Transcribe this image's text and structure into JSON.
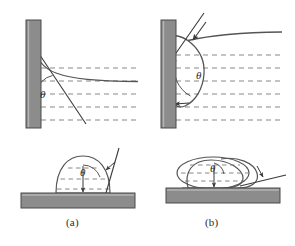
{
  "figure": {
    "type": "scientific-diagram",
    "panels": [
      {
        "id": "a",
        "caption": "(a)",
        "regime": "hydrophilic",
        "angle_symbol": "θ",
        "description": "Acute contact angle: liquid climbs the wall; droplet is a low spherical cap.",
        "top_view": {
          "kind": "vertical-wall-meniscus",
          "angle_label": "θ",
          "angle_value_deg": 40,
          "wall_side": "left",
          "meniscus": "rises-along-wall"
        },
        "bottom_view": {
          "kind": "sessile-droplet-on-substrate",
          "angle_label": "θ",
          "angle_value_deg": 75,
          "droplet_shape": "spherical-cap-tall"
        }
      },
      {
        "id": "b",
        "caption": "(b)",
        "regime": "hydrophobic",
        "angle_symbol": "θ",
        "description": "Obtuse contact angle: liquid is depressed at the wall; droplet is a flattened bead.",
        "top_view": {
          "kind": "vertical-wall-meniscus",
          "angle_label": "θ",
          "angle_value_deg": 135,
          "wall_side": "left",
          "meniscus": "bulges-away-from-wall"
        },
        "bottom_view": {
          "kind": "sessile-droplet-on-substrate",
          "angle_label": "θ",
          "angle_value_deg": 150,
          "droplet_shape": "flattened-bead"
        }
      }
    ],
    "colors": {
      "solid_fill": "#8c8c8c",
      "solid_stroke": "#4a4a4a",
      "curve_stroke": "#555555",
      "dashed_stroke": "#777777",
      "tangent_stroke": "#3a3a3a",
      "background": "#ffffff",
      "label_text": "#2b2b2b"
    },
    "elements": {
      "wall_label": "solid wall",
      "substrate_label": "solid substrate",
      "liquid_label": "liquid",
      "interface_label": "liquid-vapour interface",
      "tangent_label": "tangent line",
      "fill_pattern_label": "dashed liquid fill"
    }
  }
}
